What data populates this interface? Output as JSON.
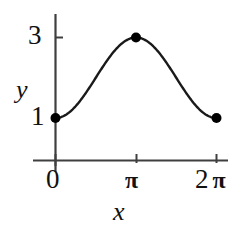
{
  "chart_data": {
    "type": "line",
    "title": "",
    "subtitle": "",
    "xlabel": "x",
    "ylabel": "y",
    "xlim": [
      0,
      6.2832
    ],
    "ylim": [
      0,
      3.45
    ],
    "grid": false,
    "legend": null,
    "curve_formula": "y = 2 - cos(x)",
    "x": [
      0,
      0.3927,
      0.7854,
      1.1781,
      1.5708,
      1.9635,
      2.3562,
      2.7489,
      3.1416,
      3.5343,
      3.927,
      4.3197,
      4.7124,
      5.1051,
      5.4978,
      5.8905,
      6.2832
    ],
    "y": [
      1.0,
      1.0761,
      1.2929,
      1.6173,
      2.0,
      2.3827,
      2.7071,
      2.9239,
      3.0,
      2.9239,
      2.7071,
      2.3827,
      2.0,
      1.6173,
      1.2929,
      1.0761,
      1.0
    ],
    "points": [
      {
        "label": "left endpoint",
        "x": 0,
        "y": 1,
        "marker": "filled-circle"
      },
      {
        "label": "maximum",
        "x": 3.1416,
        "y": 3,
        "marker": "filled-circle"
      },
      {
        "label": "right endpoint",
        "x": 6.2832,
        "y": 1,
        "marker": "filled-circle"
      }
    ],
    "x_ticks": [
      {
        "value": 0,
        "label": "0"
      },
      {
        "value": 3.1416,
        "label": "π"
      },
      {
        "value": 6.2832,
        "label": "2 π"
      }
    ],
    "y_ticks": [
      {
        "value": 1,
        "label": "1"
      },
      {
        "value": 3,
        "label": "3"
      }
    ],
    "colors": {
      "curve": "#1a1a1a",
      "axis": "#444444",
      "marker": "#000000",
      "text": "#111111",
      "background": "#ffffff"
    }
  },
  "axes": {
    "x_title": "x",
    "y_title": "y"
  },
  "ticks": {
    "y_3": "3",
    "y_1": "1",
    "x_0": "0",
    "x_pi": "π",
    "x_2pi_num": "2",
    "x_2pi_pi": "π"
  }
}
